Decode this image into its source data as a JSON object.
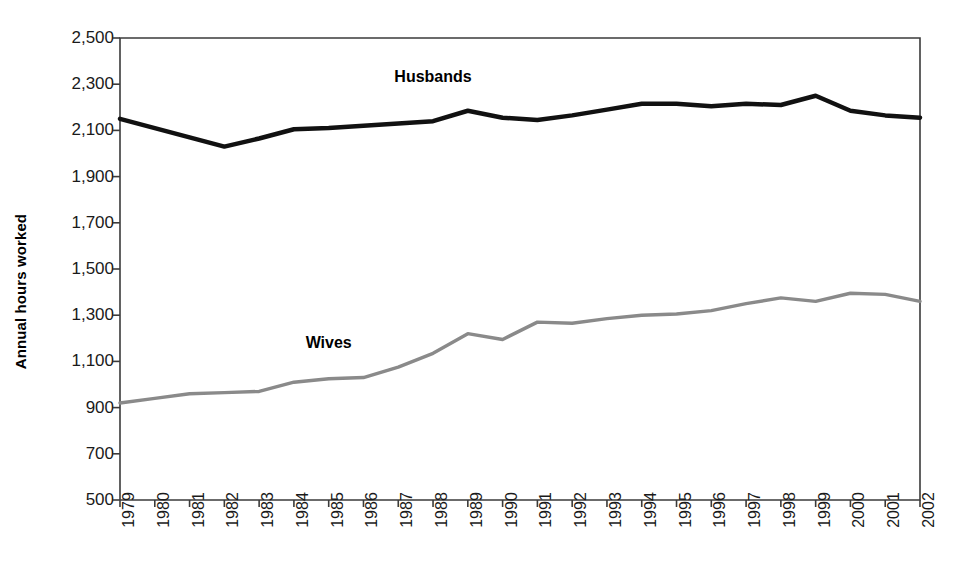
{
  "chart_data": {
    "type": "line",
    "title": "",
    "xlabel": "",
    "ylabel": "Annual hours worked",
    "ylim": [
      500,
      2500
    ],
    "ytick_step": 200,
    "grid": false,
    "legend_position": "inline-annotation",
    "yticks": [
      "2,500",
      "2,300",
      "2,100",
      "1,900",
      "1,700",
      "1,500",
      "1,300",
      "1,100",
      "900",
      "700",
      "500"
    ],
    "categories": [
      "1979",
      "1980",
      "1981",
      "1982",
      "1983",
      "1984",
      "1985",
      "1986",
      "1987",
      "1988",
      "1989",
      "1990",
      "1991",
      "1992",
      "1993",
      "1994",
      "1995",
      "1996",
      "1997",
      "1998",
      "1999",
      "2000",
      "2001",
      "2002"
    ],
    "series": [
      {
        "name": "Husbands",
        "color": "#111111",
        "line_width": 4.5,
        "label_x_year": "1988",
        "label_value": 2330,
        "values": [
          2150,
          2110,
          2070,
          2030,
          2065,
          2105,
          2110,
          2120,
          2130,
          2140,
          2185,
          2155,
          2145,
          2165,
          2190,
          2215,
          2215,
          2205,
          2215,
          2210,
          2250,
          2185,
          2165,
          2155
        ]
      },
      {
        "name": "Wives",
        "color": "#8a8a8a",
        "line_width": 3.4,
        "label_x_year": "1985",
        "label_value": 1180,
        "values": [
          920,
          940,
          960,
          965,
          970,
          1010,
          1025,
          1030,
          1075,
          1135,
          1220,
          1195,
          1270,
          1265,
          1285,
          1300,
          1305,
          1320,
          1350,
          1375,
          1360,
          1395,
          1390,
          1360
        ]
      }
    ]
  },
  "plot_area": {
    "left": 120,
    "right": 920,
    "top": 38,
    "bottom": 500,
    "border_color": "#3b3b3b"
  }
}
